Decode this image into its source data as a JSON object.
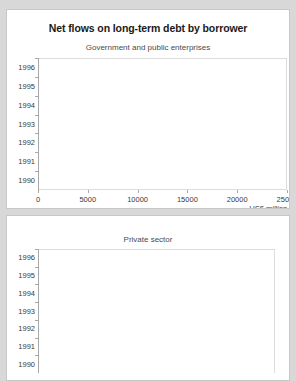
{
  "chart_data": [
    {
      "type": "bar",
      "orientation": "horizontal",
      "title": "Net flows on long-term debt by borrower",
      "subtitle": "Government and public enterprises",
      "xlabel": "US$ million",
      "ylabel": "",
      "categories": [
        "1990",
        "1991",
        "1992",
        "1993",
        "1994",
        "1995",
        "1996"
      ],
      "values": [
        18800,
        15800,
        21400,
        23800,
        17100,
        14900,
        12300
      ],
      "xlim": [
        0,
        25000
      ],
      "xticks": [
        0,
        5000,
        10000,
        15000,
        20000,
        25000
      ],
      "xtick_labels": [
        "0",
        "5000",
        "10000",
        "15000",
        "20000",
        "25000"
      ],
      "grid": false,
      "legend": "none",
      "bar_color": "#858585"
    },
    {
      "type": "bar",
      "orientation": "horizontal",
      "title": "",
      "subtitle": "Private sector",
      "xlabel": "",
      "ylabel": "",
      "categories": [
        "1990",
        "1991",
        "1992",
        "1993",
        "1994",
        "1995",
        "1996"
      ],
      "values": [
        0,
        200,
        600,
        1400,
        1100,
        2850,
        5400
      ],
      "xlim": [
        0,
        25000
      ],
      "xticks": [],
      "xtick_labels": [],
      "grid": false,
      "legend": "none",
      "note": "x-axis cropped off the bottom of the screenshot",
      "bar_color": "#858585"
    }
  ],
  "colors": {
    "page_background": "#d8d8d8",
    "panel_background": "#ffffff",
    "panel_border": "#c8c8c8",
    "bar": "#858585",
    "axis": "#a8a8a8",
    "text": "#3a3a3a",
    "title_text": "#1a1a1a"
  }
}
